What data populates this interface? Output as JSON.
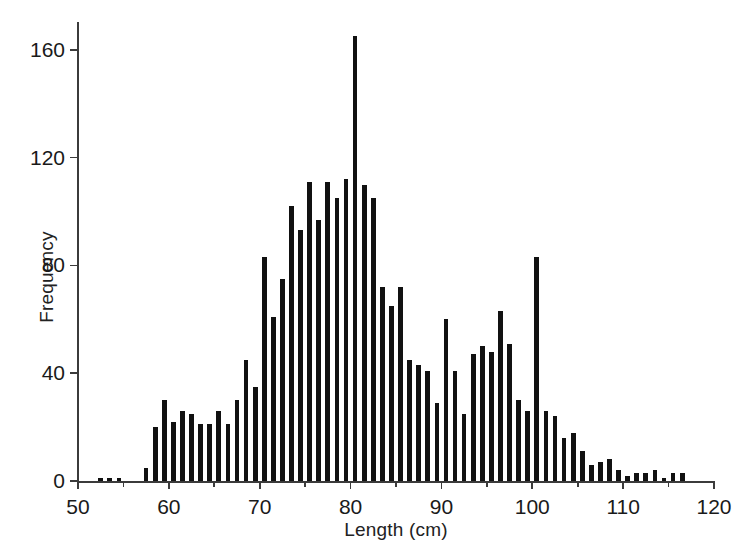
{
  "chart_data": {
    "type": "bar",
    "title": "",
    "subtitle": "",
    "xlabel": "Length (cm)",
    "ylabel": "Frequency",
    "grid": false,
    "legend": null,
    "xlim": [
      50,
      120
    ],
    "ylim": [
      0,
      170
    ],
    "bin_width": 1,
    "x_major_ticks": [
      50,
      60,
      70,
      80,
      90,
      100,
      110,
      120
    ],
    "x_minor_ticks": [
      55,
      65,
      75,
      85,
      95,
      105,
      115
    ],
    "x_tick_labels": [
      "50",
      "60",
      "70",
      "80",
      "90",
      "100",
      "110",
      "120"
    ],
    "y_ticks": [
      0,
      40,
      80,
      120,
      160
    ],
    "y_tick_labels": [
      "0",
      "40",
      "80",
      "120",
      "160"
    ],
    "bar_color": "#111111",
    "axis_color": "#3b3b3b",
    "x": [
      50,
      51,
      52,
      53,
      54,
      55,
      56,
      57,
      58,
      59,
      60,
      61,
      62,
      63,
      64,
      65,
      66,
      67,
      68,
      69,
      70,
      71,
      72,
      73,
      74,
      75,
      76,
      77,
      78,
      79,
      80,
      81,
      82,
      83,
      84,
      85,
      86,
      87,
      88,
      89,
      90,
      91,
      92,
      93,
      94,
      95,
      96,
      97,
      98,
      99,
      100,
      101,
      102,
      103,
      104,
      105,
      106,
      107,
      108,
      109,
      110,
      111,
      112,
      113,
      114,
      115,
      116,
      117,
      118,
      119
    ],
    "categories": [
      "50",
      "51",
      "52",
      "53",
      "54",
      "55",
      "56",
      "57",
      "58",
      "59",
      "60",
      "61",
      "62",
      "63",
      "64",
      "65",
      "66",
      "67",
      "68",
      "69",
      "70",
      "71",
      "72",
      "73",
      "74",
      "75",
      "76",
      "77",
      "78",
      "79",
      "80",
      "81",
      "82",
      "83",
      "84",
      "85",
      "86",
      "87",
      "88",
      "89",
      "90",
      "91",
      "92",
      "93",
      "94",
      "95",
      "96",
      "97",
      "98",
      "99",
      "100",
      "101",
      "102",
      "103",
      "104",
      "105",
      "106",
      "107",
      "108",
      "109",
      "110",
      "111",
      "112",
      "113",
      "114",
      "115",
      "116",
      "117",
      "118",
      "119"
    ],
    "values": [
      0,
      0,
      1,
      1,
      1,
      0,
      0,
      5,
      20,
      30,
      22,
      26,
      25,
      21,
      21,
      26,
      21,
      30,
      45,
      35,
      83,
      61,
      75,
      102,
      93,
      111,
      97,
      111,
      105,
      112,
      165,
      110,
      105,
      72,
      65,
      72,
      45,
      43,
      41,
      29,
      60,
      41,
      25,
      47,
      50,
      48,
      63,
      51,
      30,
      26,
      83,
      26,
      24,
      16,
      18,
      11,
      6,
      7,
      8,
      4,
      2,
      3,
      3,
      4,
      1,
      3,
      3,
      0,
      0,
      0
    ],
    "annotations": [
      {
        "text": "peak bin at 80 cm",
        "x": 80,
        "y": 165
      }
    ]
  }
}
